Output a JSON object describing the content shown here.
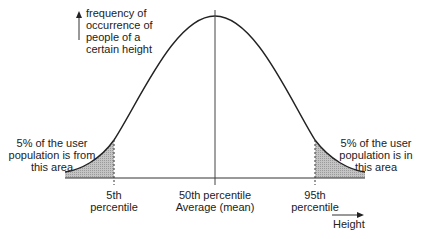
{
  "diagram": {
    "type": "normal-distribution",
    "y_axis_label": [
      "frequency of",
      "occurrence of",
      "people of a",
      "certain height"
    ],
    "x_axis_label": "Height",
    "left_tail_note": [
      "5% of the user",
      "population is from",
      "this area"
    ],
    "right_tail_note": [
      "5% of the user",
      "population is in",
      "this area"
    ],
    "markers": [
      {
        "id": "p5",
        "lines": [
          "5th",
          "percentile"
        ]
      },
      {
        "id": "p50",
        "lines": [
          "50th percentile",
          "Average (mean)"
        ]
      },
      {
        "id": "p95",
        "lines": [
          "95th",
          "percentile"
        ]
      }
    ],
    "colors": {
      "curve": "#222222",
      "shade": "#bdbdbd",
      "axis": "#333333"
    }
  }
}
